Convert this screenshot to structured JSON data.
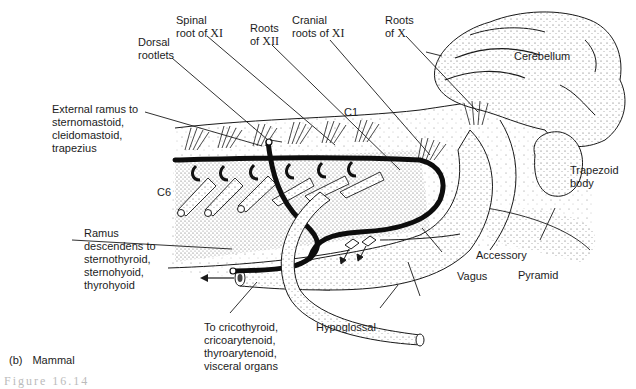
{
  "figure": {
    "panel_letter": "(b)",
    "panel_title": "Mammal",
    "caption_fragment": "Figure 16.14",
    "colors": {
      "ink": "#1a1a1a",
      "background": "#ffffff",
      "stipple": "#555555",
      "nerve": "#111111"
    }
  },
  "labels": {
    "spinal_root_xi": {
      "line1": "Spinal",
      "line2_text": "root of ",
      "line2_roman": "XI"
    },
    "roots_xii": {
      "line1": "Roots",
      "line2_text": "of ",
      "line2_roman": "XII"
    },
    "cranial_roots_xi": {
      "line1": "Cranial",
      "line2_text": "roots of ",
      "line2_roman": "XI"
    },
    "roots_x": {
      "line1": "Roots",
      "line2_text": "of ",
      "line2_roman": "X"
    },
    "dorsal_rootlets": {
      "line1": "Dorsal",
      "line2": "rootlets"
    },
    "cerebellum": "Cerebellum",
    "c1": "C1",
    "c6": "C6",
    "external_ramus": [
      "External ramus to",
      "sternomastoid,",
      "cleidomastoid,",
      "trapezius"
    ],
    "trapezoid_body": [
      "Trapezoid",
      "body"
    ],
    "ramus_descendens": [
      "Ramus",
      "descendens to",
      "sternothyroid,",
      "sternohyoid,",
      "thyrohyoid"
    ],
    "accessory": "Accessory",
    "vagus": "Vagus",
    "pyramid": "Pyramid",
    "hypoglossal": "Hypoglossal",
    "to_cricothyroid": [
      "To cricothyroid,",
      "cricoarytenoid,",
      "thyroarytenoid,",
      "visceral organs"
    ]
  }
}
